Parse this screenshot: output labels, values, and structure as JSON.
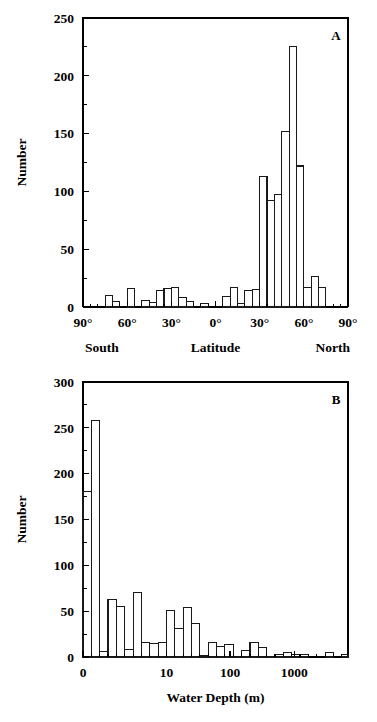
{
  "figure": {
    "background": "#ffffff",
    "ink_color": "#000000",
    "panels": [
      "A",
      "B"
    ]
  },
  "chart_data": [
    {
      "type": "bar",
      "panel_label": "A",
      "title": "",
      "xlabel": "Latitude",
      "ylabel": "Number",
      "xlim": [
        -90,
        90
      ],
      "ylim": [
        0,
        250
      ],
      "grid": false,
      "legend": null,
      "x_tick_labels": [
        "90°",
        "60°",
        "30°",
        "0°",
        "30°",
        "60°",
        "90°"
      ],
      "x_tick_values": [
        -90,
        -60,
        -30,
        0,
        30,
        60,
        90
      ],
      "x_minor_step": 5,
      "y_tick_labels": [
        "0",
        "50",
        "100",
        "150",
        "200",
        "250"
      ],
      "y_tick_values": [
        0,
        50,
        100,
        150,
        200,
        250
      ],
      "y_minor_step": 25,
      "hemisphere_left_label": "South",
      "hemisphere_right_label": "North",
      "bin_width": 5,
      "bin_starts": [
        -90,
        -85,
        -80,
        -75,
        -70,
        -65,
        -60,
        -55,
        -50,
        -45,
        -40,
        -35,
        -30,
        -25,
        -20,
        -15,
        -10,
        -5,
        0,
        5,
        10,
        15,
        20,
        25,
        30,
        35,
        40,
        45,
        50,
        55,
        60,
        65,
        70,
        75,
        80,
        85
      ],
      "values": [
        0,
        0,
        0,
        10,
        5,
        0,
        16,
        0,
        6,
        4,
        14,
        16,
        17,
        8,
        5,
        0,
        3,
        0,
        0,
        9,
        17,
        3,
        14,
        15,
        113,
        92,
        97,
        152,
        225,
        122,
        17,
        26,
        17,
        0,
        0,
        0
      ]
    },
    {
      "type": "bar",
      "panel_label": "B",
      "title": "",
      "xlabel": "Water Depth (m)",
      "ylabel": "Number",
      "xscale": "log-like",
      "ylim": [
        0,
        300
      ],
      "grid": false,
      "legend": null,
      "x_tick_labels": [
        "0",
        "10",
        "100",
        "1000"
      ],
      "x_tick_positions": [
        0.0,
        0.315,
        0.555,
        0.797
      ],
      "y_tick_labels": [
        "0",
        "50",
        "100",
        "150",
        "200",
        "250",
        "300"
      ],
      "y_tick_values": [
        0,
        50,
        100,
        150,
        200,
        250,
        300
      ],
      "y_minor_step": 25,
      "bins": [
        {
          "x0": 0.0,
          "x1": 0.0315,
          "value": 181
        },
        {
          "x0": 0.0315,
          "x1": 0.063,
          "value": 258
        },
        {
          "x0": 0.063,
          "x1": 0.0945,
          "value": 6
        },
        {
          "x0": 0.0945,
          "x1": 0.126,
          "value": 63
        },
        {
          "x0": 0.126,
          "x1": 0.1575,
          "value": 55
        },
        {
          "x0": 0.1575,
          "x1": 0.189,
          "value": 8
        },
        {
          "x0": 0.189,
          "x1": 0.2205,
          "value": 70
        },
        {
          "x0": 0.2205,
          "x1": 0.252,
          "value": 16
        },
        {
          "x0": 0.252,
          "x1": 0.2835,
          "value": 15
        },
        {
          "x0": 0.2835,
          "x1": 0.315,
          "value": 16
        },
        {
          "x0": 0.315,
          "x1": 0.3465,
          "value": 51
        },
        {
          "x0": 0.3465,
          "x1": 0.378,
          "value": 31
        },
        {
          "x0": 0.378,
          "x1": 0.4095,
          "value": 54
        },
        {
          "x0": 0.4095,
          "x1": 0.441,
          "value": 37
        },
        {
          "x0": 0.441,
          "x1": 0.4725,
          "value": 2
        },
        {
          "x0": 0.4725,
          "x1": 0.504,
          "value": 16
        },
        {
          "x0": 0.504,
          "x1": 0.5355,
          "value": 11
        },
        {
          "x0": 0.5355,
          "x1": 0.567,
          "value": 14
        },
        {
          "x0": 0.567,
          "x1": 0.5985,
          "value": 1
        },
        {
          "x0": 0.5985,
          "x1": 0.63,
          "value": 7
        },
        {
          "x0": 0.63,
          "x1": 0.6615,
          "value": 16
        },
        {
          "x0": 0.6615,
          "x1": 0.693,
          "value": 10
        },
        {
          "x0": 0.693,
          "x1": 0.7245,
          "value": 1
        },
        {
          "x0": 0.7245,
          "x1": 0.756,
          "value": 3
        },
        {
          "x0": 0.756,
          "x1": 0.7875,
          "value": 5
        },
        {
          "x0": 0.7875,
          "x1": 0.819,
          "value": 3
        },
        {
          "x0": 0.819,
          "x1": 0.8505,
          "value": 3
        },
        {
          "x0": 0.8505,
          "x1": 0.882,
          "value": 0
        },
        {
          "x0": 0.882,
          "x1": 0.9135,
          "value": 0
        },
        {
          "x0": 0.9135,
          "x1": 0.945,
          "value": 5
        },
        {
          "x0": 0.945,
          "x1": 0.9765,
          "value": 0
        },
        {
          "x0": 0.9765,
          "x1": 1.0,
          "value": 3
        }
      ]
    }
  ]
}
